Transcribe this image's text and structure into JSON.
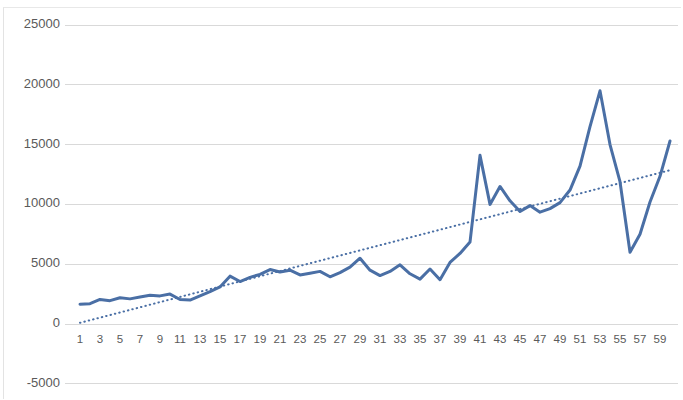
{
  "chart_data": {
    "type": "line",
    "title": "",
    "subtitle": "",
    "xlabel": "",
    "ylabel": "",
    "grid": true,
    "legend": "none",
    "ylim": [
      -5000,
      25000
    ],
    "ytick_labels": [
      "25000",
      "20000",
      "15000",
      "10000",
      "5000",
      "0",
      "-5000"
    ],
    "ytick_values": [
      25000,
      20000,
      15000,
      10000,
      5000,
      0,
      -5000
    ],
    "xlim": [
      1,
      60
    ],
    "x": [
      1,
      2,
      3,
      4,
      5,
      6,
      7,
      8,
      9,
      10,
      11,
      12,
      13,
      14,
      15,
      16,
      17,
      18,
      19,
      20,
      21,
      22,
      23,
      24,
      25,
      26,
      27,
      28,
      29,
      30,
      31,
      32,
      33,
      34,
      35,
      36,
      37,
      38,
      39,
      40,
      41,
      42,
      43,
      44,
      45,
      46,
      47,
      48,
      49,
      50,
      51,
      52,
      53,
      54,
      55,
      56,
      57,
      58,
      59,
      60
    ],
    "xtick_labels": [
      "1",
      "3",
      "5",
      "7",
      "9",
      "11",
      "13",
      "15",
      "17",
      "19",
      "21",
      "23",
      "25",
      "27",
      "29",
      "31",
      "33",
      "35",
      "37",
      "39",
      "41",
      "43",
      "45",
      "47",
      "49",
      "51",
      "53",
      "55",
      "57",
      "59"
    ],
    "series": [
      {
        "name": "value",
        "type": "line",
        "color": "#4a6fa5",
        "width": 3,
        "style": "solid",
        "values": [
          1650,
          1700,
          2050,
          1950,
          2200,
          2100,
          2250,
          2400,
          2350,
          2500,
          2050,
          2000,
          2350,
          2700,
          3100,
          4000,
          3550,
          3900,
          4150,
          4550,
          4350,
          4500,
          4100,
          4250,
          4400,
          3950,
          4300,
          4750,
          5500,
          4500,
          4050,
          4400,
          4950,
          4200,
          3750,
          4600,
          3700,
          5150,
          5900,
          6850,
          14100,
          10000,
          11500,
          10300,
          9400,
          9900,
          9350,
          9650,
          10150,
          11200,
          13200,
          16500,
          19500,
          15000,
          11900,
          6000,
          7500,
          10200,
          12350,
          15300
        ]
      },
      {
        "name": "trendline",
        "type": "line",
        "color": "#4a6fa5",
        "width": 2,
        "style": "dotted",
        "values": [
          100,
          316,
          532,
          749,
          965,
          1181,
          1397,
          1614,
          1830,
          2046,
          2262,
          2479,
          2695,
          2911,
          3127,
          3344,
          3560,
          3776,
          3992,
          4209,
          4425,
          4641,
          4857,
          5074,
          5290,
          5506,
          5722,
          5939,
          6155,
          6371,
          6587,
          6804,
          7020,
          7236,
          7452,
          7669,
          7885,
          8101,
          8317,
          8534,
          8750,
          8966,
          9182,
          9399,
          9615,
          9831,
          10047,
          10264,
          10480,
          10696,
          10912,
          11129,
          11345,
          11561,
          11777,
          11994,
          12210,
          12426,
          12642,
          12859
        ]
      }
    ],
    "colors": {
      "series_blue": "#4a6fa5",
      "gridline": "#d9d9d9",
      "tick_text": "#5a5a5a",
      "background": "#ffffff"
    }
  }
}
